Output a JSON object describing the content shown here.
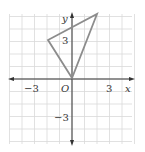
{
  "diagram": {
    "type": "coordinate-plane",
    "axes": {
      "x_label": "x",
      "y_label": "y",
      "origin_label": "O",
      "x_ticks": [
        {
          "value": -3,
          "label": "−3"
        },
        {
          "value": 3,
          "label": "3"
        }
      ],
      "y_ticks": [
        {
          "value": 3,
          "label": "3"
        },
        {
          "value": -3,
          "label": "−3"
        }
      ],
      "x_range": [
        -5,
        5
      ],
      "y_range": [
        -5,
        5
      ],
      "grid": true
    },
    "triangle": {
      "vertices": [
        [
          0,
          0
        ],
        [
          -2,
          3
        ],
        [
          2,
          5
        ]
      ],
      "stroke": "#8c8c8c"
    },
    "colors": {
      "grid": "#d9d9d9",
      "axis": "#333333",
      "shape": "#8c8c8c"
    }
  }
}
